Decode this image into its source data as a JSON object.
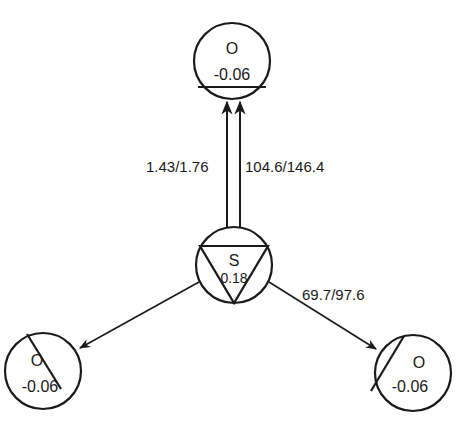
{
  "nodes": {
    "top": {
      "label": "O",
      "value": "-0.06"
    },
    "center": {
      "label": "S",
      "value": "0.18"
    },
    "bottom_left": {
      "label": "O",
      "value": "-0.06"
    },
    "bottom_right": {
      "label": "O",
      "value": "-0.06"
    }
  },
  "edges": {
    "center_to_top_left_label": "1.43/1.76",
    "center_to_top_right_label": "104.6/146.4",
    "center_to_bottom_right_label": "69.7/97.6"
  },
  "colors": {
    "ink": "#1a1a1a",
    "background": "#ffffff"
  }
}
